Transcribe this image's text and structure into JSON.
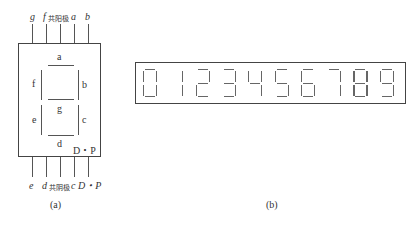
{
  "panel_a": {
    "caption": "(a)",
    "top_pins": [
      {
        "label": "g",
        "italic": true
      },
      {
        "label": "f",
        "italic": true
      },
      {
        "label": "共阳极",
        "italic": false
      },
      {
        "label": "a",
        "italic": true
      },
      {
        "label": "b",
        "italic": true
      }
    ],
    "bottom_pins": [
      {
        "label": "e",
        "italic": true
      },
      {
        "label": "d",
        "italic": true
      },
      {
        "label": "共阴极",
        "italic": false
      },
      {
        "label": "c",
        "italic": true
      },
      {
        "label": "D・P",
        "italic": true
      }
    ],
    "segments": {
      "a": "a",
      "b": "b",
      "c": "c",
      "d": "d",
      "e": "e",
      "f": "f",
      "g": "g",
      "dp": "D・P"
    }
  },
  "panel_b": {
    "caption": "(b)",
    "digits": [
      "0",
      "1",
      "2",
      "3",
      "4",
      "5",
      "6",
      "7",
      "8",
      "9"
    ]
  },
  "colors": {
    "line": "#555555",
    "text": "#333333",
    "background": "#ffffff"
  }
}
